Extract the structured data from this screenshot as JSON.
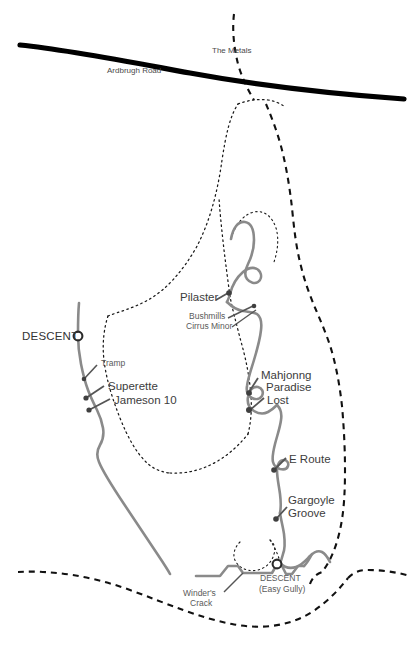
{
  "map": {
    "title": "Ardbrugh Road crag topo",
    "width": 414,
    "height": 657,
    "background_color": "#ffffff",
    "colors": {
      "road": "#000000",
      "crag_line": "#8a8a8a",
      "route_tick": "#555555",
      "dotted_path": "#1a1a1a",
      "dashed_path": "#111111",
      "label_text": "#4d4d4d",
      "major_label_text": "#3c3c3c"
    }
  },
  "labels": {
    "road": "Ardbrugh Road",
    "metals": "The Metals",
    "descent_left": "DESCENT",
    "tramp": "Tramp",
    "superette": "Superette",
    "jameson": "Jameson 10",
    "pilaster": "Pilaster",
    "bushmills": "Bushmills",
    "cirrus_minor": "Cirrus Minor",
    "mahjonng": "Mahjonng",
    "paradise": "Paradise",
    "lost": "Lost",
    "e_route": "E Route",
    "gargoyle": "Gargoyle",
    "groove": "Groove",
    "winders": "Winder's",
    "crack": "Crack",
    "descent_bottom": "DESCENT",
    "descent_bottom_sub": "(Easy Gully)"
  },
  "features": {
    "roads": [
      {
        "name": "Ardbrugh Road",
        "label": "Ardbrugh Road",
        "style": "thick-solid-black"
      }
    ],
    "paths": [
      {
        "name": "The Metals",
        "label": "The Metals",
        "style": "bold-dashed"
      },
      {
        "name": "approach-path",
        "label": "",
        "style": "fine-dotted"
      },
      {
        "name": "lower-boundary-path",
        "label": "",
        "style": "bold-dashed"
      }
    ],
    "descents": [
      {
        "name": "descent-upper-left",
        "label": "DESCENT",
        "marker": "ring-circle"
      },
      {
        "name": "descent-easy-gully",
        "label": "DESCENT",
        "sublabel": "(Easy Gully)",
        "marker": "ring-circle"
      }
    ],
    "routes": [
      {
        "name": "Tramp",
        "label": "Tramp",
        "side": "left-buttress"
      },
      {
        "name": "Superette",
        "label": "Superette",
        "side": "left-buttress"
      },
      {
        "name": "Jameson 10",
        "label": "Jameson 10",
        "side": "left-buttress"
      },
      {
        "name": "Pilaster",
        "label": "Pilaster",
        "side": "main-crag"
      },
      {
        "name": "Bushmills",
        "label": "Bushmills",
        "side": "main-crag"
      },
      {
        "name": "Cirrus Minor",
        "label": "Cirrus Minor",
        "side": "main-crag"
      },
      {
        "name": "Mahjonng",
        "label": "Mahjonng",
        "side": "main-crag"
      },
      {
        "name": "Paradise Lost",
        "label": "Paradise",
        "label2": "Lost",
        "side": "main-crag"
      },
      {
        "name": "E Route",
        "label": "E Route",
        "side": "main-crag"
      },
      {
        "name": "Gargoyle Groove",
        "label": "Gargoyle",
        "label2": "Groove",
        "side": "main-crag"
      },
      {
        "name": "Winder's Crack",
        "label": "Winder's",
        "label2": "Crack",
        "side": "lower-crag"
      }
    ]
  }
}
